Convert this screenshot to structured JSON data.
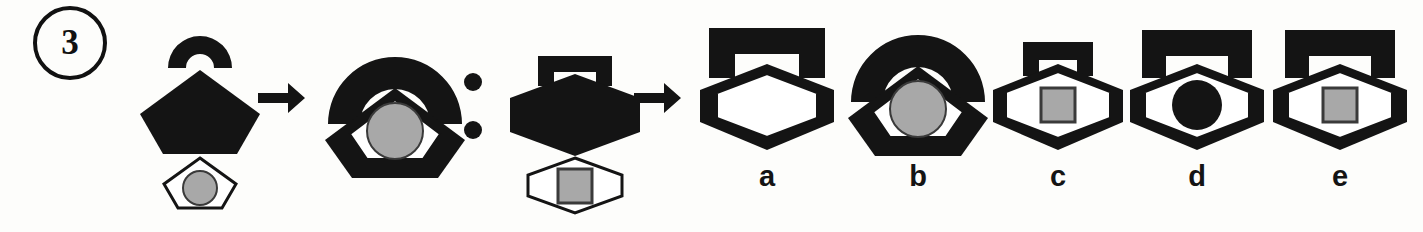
{
  "item": {
    "number": "3",
    "type": "visual-analogy",
    "relation_separator": ":",
    "transform_symbol": "→"
  },
  "palette": {
    "ink": "#141414",
    "paper": "#fdfdfb",
    "gray_fill": "#a8a8a8",
    "gray_stroke": "#3a3a3a"
  },
  "analogy": {
    "a_label": "A",
    "b_label": "B",
    "c_label": "C",
    "d_label": "?",
    "prompt_reads_as": "A is to B as C is to ?"
  },
  "figures": {
    "A": {
      "name": "source-a",
      "components": [
        {
          "shape": "arc",
          "fill": "black",
          "note": "open half-donut arch, detached above"
        },
        {
          "shape": "pentagon",
          "fill": "black",
          "note": "large solid pentagon"
        },
        {
          "shape": "pentagon",
          "fill": "white",
          "note": "small outlined pentagon, detached below"
        },
        {
          "shape": "circle",
          "fill": "gray",
          "note": "inside small pentagon"
        }
      ],
      "arrangement": "stacked-separate"
    },
    "B": {
      "name": "result-b",
      "components": [
        {
          "shape": "arc",
          "fill": "black"
        },
        {
          "shape": "pentagon",
          "fill": "black"
        },
        {
          "shape": "pentagon",
          "fill": "white"
        },
        {
          "shape": "circle",
          "fill": "gray"
        }
      ],
      "arrangement": "merged-concentric"
    },
    "C": {
      "name": "source-c",
      "components": [
        {
          "shape": "bracket",
          "fill": "black",
          "note": "squared arch / table shape, detached above"
        },
        {
          "shape": "hexagon",
          "fill": "black",
          "note": "large solid hexagon"
        },
        {
          "shape": "hexagon",
          "fill": "white",
          "note": "small outlined hexagon, detached below"
        },
        {
          "shape": "square",
          "fill": "gray",
          "note": "inside small hexagon"
        }
      ],
      "arrangement": "stacked-separate"
    }
  },
  "options": [
    {
      "key": "a",
      "label": "a",
      "variant": "bracket-hexagon-white-hexagon-empty",
      "components": [
        {
          "shape": "bracket",
          "fill": "black"
        },
        {
          "shape": "hexagon",
          "fill": "black"
        },
        {
          "shape": "hexagon",
          "fill": "white"
        }
      ]
    },
    {
      "key": "b",
      "label": "b",
      "variant": "arc-pentagon-white-pentagon-gray-circle",
      "components": [
        {
          "shape": "arc",
          "fill": "black"
        },
        {
          "shape": "pentagon",
          "fill": "black"
        },
        {
          "shape": "pentagon",
          "fill": "white"
        },
        {
          "shape": "circle",
          "fill": "gray"
        }
      ]
    },
    {
      "key": "c",
      "label": "c",
      "variant": "small-bracket-hexagon-white-hexagon-gray-square",
      "components": [
        {
          "shape": "bracket",
          "fill": "black",
          "size": "small"
        },
        {
          "shape": "hexagon",
          "fill": "black"
        },
        {
          "shape": "hexagon",
          "fill": "white"
        },
        {
          "shape": "square",
          "fill": "gray"
        }
      ]
    },
    {
      "key": "d",
      "label": "d",
      "variant": "bracket-hexagon-white-hexagon-black-circle",
      "components": [
        {
          "shape": "bracket",
          "fill": "black"
        },
        {
          "shape": "hexagon",
          "fill": "black"
        },
        {
          "shape": "hexagon",
          "fill": "white"
        },
        {
          "shape": "circle",
          "fill": "black"
        }
      ]
    },
    {
      "key": "e",
      "label": "e",
      "variant": "bracket-hexagon-white-hexagon-gray-square",
      "components": [
        {
          "shape": "bracket",
          "fill": "black"
        },
        {
          "shape": "hexagon",
          "fill": "black"
        },
        {
          "shape": "hexagon",
          "fill": "white"
        },
        {
          "shape": "square",
          "fill": "gray"
        }
      ]
    }
  ]
}
